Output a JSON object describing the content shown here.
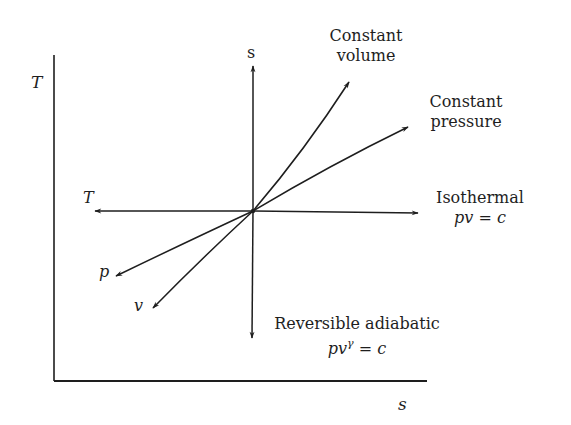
{
  "diagram": {
    "axes": {
      "y_label": "T",
      "x_label": "s"
    },
    "inner_axes": {
      "up_label": "s",
      "left_label": "T"
    },
    "processes": [
      {
        "id": "constant-volume",
        "line1": "Constant",
        "line2": "volume"
      },
      {
        "id": "constant-pressure",
        "line1": "Constant",
        "line2": "pressure"
      },
      {
        "id": "isothermal",
        "line1": "Isothermal",
        "equation_pre": "pv",
        "equation_post": " = c"
      },
      {
        "id": "reversible-adiabatic",
        "line1": "Reversible adiabatic",
        "equation_pre": "pv",
        "equation_sup": "γ",
        "equation_post": " = c"
      }
    ],
    "branch_labels": {
      "p": "p",
      "v": "v"
    },
    "colors": {
      "ink": "#1e1e1e",
      "background": "#ffffff"
    }
  }
}
